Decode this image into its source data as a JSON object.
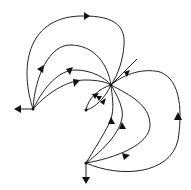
{
  "diagram": {
    "type": "phase-portrait",
    "colors": {
      "stroke": "#222222",
      "arrow": "#111111",
      "background": "#ffffff"
    },
    "nodes": [
      {
        "id": "center",
        "role": "sink"
      },
      {
        "id": "left",
        "role": "source"
      },
      {
        "id": "bottom",
        "role": "source"
      },
      {
        "id": "inner",
        "role": "source"
      }
    ],
    "trajectories": [
      {
        "from": "left",
        "to": "center",
        "label": ""
      },
      {
        "from": "left",
        "to": "center",
        "label": ""
      },
      {
        "from": "left",
        "to": "center",
        "label": ""
      },
      {
        "from": "left",
        "to": "center",
        "label": ""
      },
      {
        "from": "left",
        "to": "outside",
        "label": ""
      },
      {
        "from": "bottom",
        "to": "center",
        "label": ""
      },
      {
        "from": "bottom",
        "to": "center",
        "label": ""
      },
      {
        "from": "bottom",
        "to": "center",
        "label": ""
      },
      {
        "from": "bottom",
        "to": "center",
        "label": ""
      },
      {
        "from": "bottom",
        "to": "outside",
        "label": ""
      },
      {
        "from": "inner",
        "to": "center",
        "label": ""
      },
      {
        "from": "inner",
        "to": "center",
        "label": ""
      },
      {
        "from": "outside",
        "to": "center",
        "label": ""
      }
    ]
  }
}
